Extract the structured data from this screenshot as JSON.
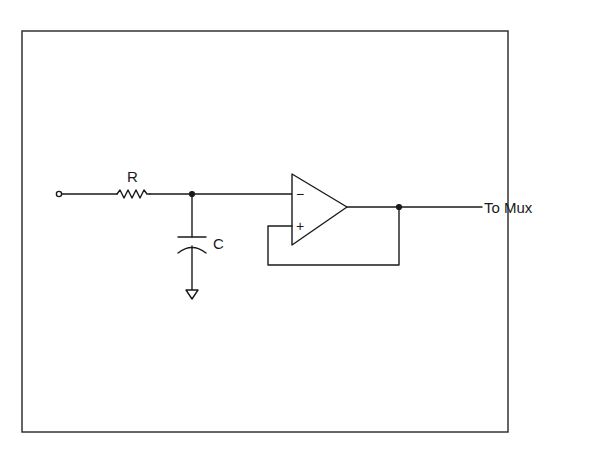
{
  "diagram": {
    "type": "circuit-schematic",
    "components": {
      "resistor": {
        "label": "R"
      },
      "capacitor": {
        "label": "C"
      },
      "opamp": {
        "inverting_symbol": "−",
        "noninverting_symbol": "+"
      },
      "output": {
        "label": "To Mux"
      }
    },
    "colors": {
      "line": "#1a1a1a",
      "border": "#333333",
      "background": "#ffffff"
    }
  }
}
